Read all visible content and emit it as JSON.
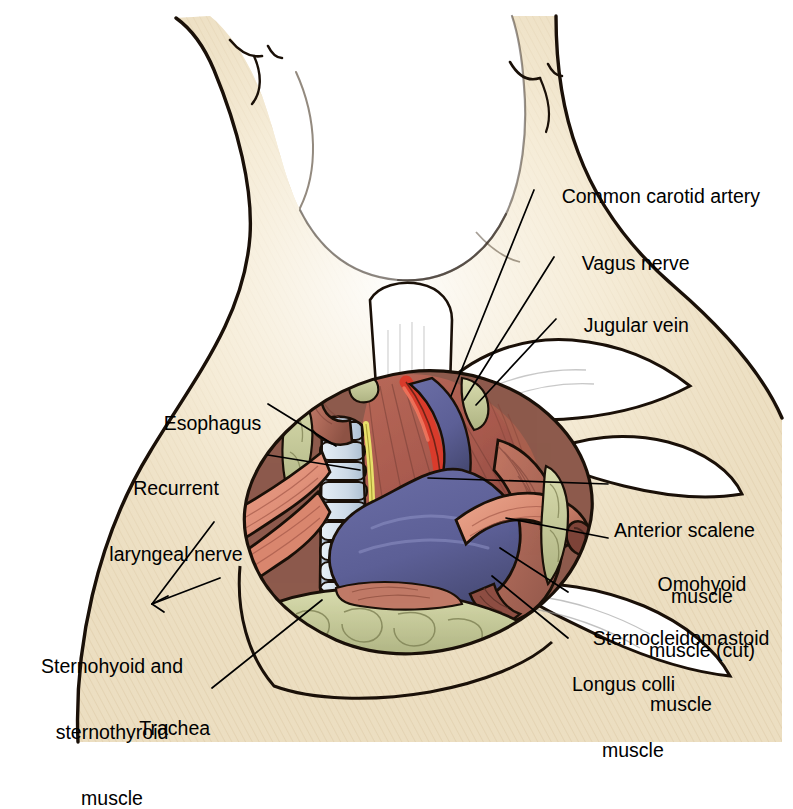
{
  "figure": {
    "background_color": "#ffffff"
  },
  "palette": {
    "skin": "#ede0c4",
    "skin_light": "#f7efdc",
    "skin_shadow": "#d9c49c",
    "outline": "#1a1008",
    "muscle_deep": "#a85a4e",
    "muscle_mid": "#c07463",
    "muscle_light": "#e08f78",
    "muscle_strap": "#e3927b",
    "artery_red": "#d93b2b",
    "vein_blue": "#5c5f96",
    "vein_blue_dark": "#46496f",
    "nerve_yellow": "#e8e06a",
    "cartilage": "#ccd9e6",
    "cartilage_shadow": "#a8bccf",
    "fat_olive": "#cdd0a0",
    "fat_olive_dark": "#a8ad7c",
    "esophagus": "#b06b5a",
    "retractor_white": "#ffffff",
    "text": "#000000"
  },
  "labels": [
    {
      "id": "common-carotid-artery",
      "text": "Common carotid artery",
      "lines": [
        "Common carotid artery"
      ],
      "side": "right",
      "x": 540,
      "y": 163,
      "align": "left",
      "leader": {
        "x1": 534,
        "y1": 190,
        "x2": 451,
        "y2": 396
      }
    },
    {
      "id": "vagus-nerve",
      "text": "Vagus nerve",
      "lines": [
        "Vagus nerve"
      ],
      "side": "right",
      "x": 560,
      "y": 230,
      "align": "left",
      "leader": {
        "x1": 554,
        "y1": 257,
        "x2": 464,
        "y2": 400
      }
    },
    {
      "id": "jugular-vein",
      "text": "Jugular vein",
      "lines": [
        "Jugular vein"
      ],
      "side": "right",
      "x": 562,
      "y": 292,
      "align": "left",
      "leader": {
        "x1": 556,
        "y1": 319,
        "x2": 476,
        "y2": 405
      }
    },
    {
      "id": "esophagus",
      "text": "Esophagus",
      "lines": [
        "Esophagus"
      ],
      "side": "left",
      "x": 142,
      "y": 390,
      "align": "left",
      "leader": {
        "x1": 268,
        "y1": 406,
        "x2": 335,
        "y2": 445
      }
    },
    {
      "id": "recurrent-laryngeal-nerve",
      "text": "Recurrent laryngeal nerve",
      "lines": [
        "Recurrent",
        "laryngeal nerve"
      ],
      "side": "left",
      "x": 96,
      "y": 433,
      "align": "left",
      "leader": {
        "x1": 268,
        "y1": 455,
        "x2": 357,
        "y2": 470
      }
    },
    {
      "id": "anterior-scalene-muscle",
      "text": "Anterior scalene muscle",
      "lines": [
        "Anterior scalene",
        "muscle"
      ],
      "side": "right",
      "x": 614,
      "y": 475,
      "align": "left",
      "leader": {
        "x1": 608,
        "y1": 483,
        "x2": 428,
        "y2": 478
      }
    },
    {
      "id": "omohyoid-muscle-cut",
      "text": "Omohyoid muscle (cut)",
      "lines": [
        "Omohyoid",
        "muscle (cut)"
      ],
      "side": "right",
      "x": 614,
      "y": 529,
      "align": "left",
      "leader": {
        "x1": 608,
        "y1": 538,
        "x2": 508,
        "y2": 520
      }
    },
    {
      "id": "sternocleidomastoid-muscle",
      "text": "Sternocleidomastoid muscle",
      "lines": [
        "Sternocleidomastoid",
        "muscle"
      ],
      "side": "right",
      "x": 574,
      "y": 583,
      "align": "left",
      "leader": {
        "x1": 568,
        "y1": 592,
        "x2": 500,
        "y2": 548
      }
    },
    {
      "id": "longus-colli-muscle",
      "text": "Longus colli muscle",
      "lines": [
        "Longus colli",
        "muscle"
      ],
      "side": "right",
      "x": 574,
      "y": 629,
      "align": "left",
      "leader": {
        "x1": 568,
        "y1": 638,
        "x2": 490,
        "y2": 575
      }
    },
    {
      "id": "sternohyoid-and-sternothyroid-muscle",
      "text": "Sternohyoid and sternothyroid muscle",
      "lines": [
        "Sternohyoid and",
        "sternothyroid",
        "muscle"
      ],
      "side": "left",
      "x": 30,
      "y": 611,
      "align": "left",
      "leader": {
        "x1": 150,
        "y1": 605,
        "x2": 216,
        "y2": 520
      },
      "leader2": {
        "x1": 150,
        "y1": 605,
        "x2": 222,
        "y2": 578
      }
    },
    {
      "id": "trachea",
      "text": "Trachea",
      "lines": [
        "Trachea"
      ],
      "side": "left",
      "x": 118,
      "y": 695,
      "align": "left",
      "leader": {
        "x1": 212,
        "y1": 690,
        "x2": 320,
        "y2": 600
      }
    }
  ],
  "anatomy": {
    "structures": [
      {
        "id": "neck-skin",
        "name": "Neck and shoulder skin",
        "color": "#ede0c4"
      },
      {
        "id": "trachea",
        "name": "Trachea",
        "color": "#ccd9e6",
        "rings": 9
      },
      {
        "id": "esophagus",
        "name": "Esophagus",
        "color": "#b06b5a"
      },
      {
        "id": "recurrent-laryngeal-nerve",
        "name": "Recurrent laryngeal nerve",
        "color": "#e8e06a"
      },
      {
        "id": "common-carotid-artery",
        "name": "Common carotid artery",
        "color": "#d93b2b"
      },
      {
        "id": "vagus-nerve",
        "name": "Vagus nerve",
        "color": "#e8e06a"
      },
      {
        "id": "jugular-vein",
        "name": "Internal jugular vein",
        "color": "#5c5f96"
      },
      {
        "id": "anterior-scalene-muscle",
        "name": "Anterior scalene muscle",
        "color": "#a85a4e"
      },
      {
        "id": "longus-colli-muscle",
        "name": "Longus colli muscle",
        "color": "#b06a59"
      },
      {
        "id": "omohyoid-muscle",
        "name": "Omohyoid muscle (cut)",
        "color": "#dd9079"
      },
      {
        "id": "sternocleidomastoid-muscle",
        "name": "Sternocleidomastoid muscle",
        "color": "#b87060"
      },
      {
        "id": "strap-muscles",
        "name": "Sternohyoid and sternothyroid muscle",
        "color": "#e3927b"
      },
      {
        "id": "fat-pad",
        "name": "Fatty areolar tissue",
        "color": "#cdd0a0"
      }
    ]
  }
}
